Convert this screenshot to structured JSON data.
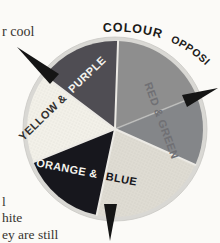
{
  "page": {
    "background": "#fbfaf7",
    "margin_text": {
      "top_fragment": "r cool",
      "bottom_fragments": [
        "l",
        "hite",
        "ey are still"
      ]
    }
  },
  "wheel": {
    "title": {
      "word1": "COLOUR",
      "word2": "OPPOSITES"
    },
    "labels": {
      "yellow_purple": {
        "on_yellow": "YELLOW &",
        "on_purple": "PURPLE"
      },
      "red_green": "RED & GREEN",
      "orange_blue": {
        "on_blue": "ORANGE &",
        "on_orange": "BLUE"
      }
    },
    "colors": {
      "rim": "#d9d8d4",
      "red": "#8e8e8e",
      "green": "#848689",
      "purple": "#4f4d53",
      "yellow": "#f3f1e9",
      "blue": "#17171d",
      "orange": "#dfdcd3",
      "arrow": "#151515"
    }
  }
}
